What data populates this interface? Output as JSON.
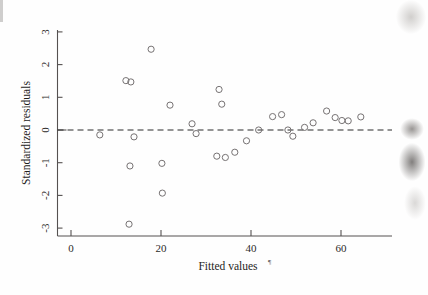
{
  "chart_data": {
    "type": "scatter",
    "title": "",
    "xlabel": "Fitted values",
    "ylabel": "Standardized residuals",
    "xlim": [
      -4,
      71
    ],
    "ylim": [
      -3.35,
      3.35
    ],
    "xticks": [
      0,
      20,
      40,
      60
    ],
    "xtick_labels": [
      "0",
      "20",
      "40",
      "60"
    ],
    "yticks": [
      -3,
      -2,
      -1,
      0,
      1,
      2,
      3
    ],
    "ytick_labels": [
      "-3",
      "-2",
      "-1",
      "0",
      "1",
      "2",
      "3"
    ],
    "grid": false,
    "legend": null,
    "reference_line": {
      "type": "horizontal",
      "y": 0,
      "style": "dashed"
    },
    "marker": {
      "shape": "circle",
      "filled": false,
      "radius_px": 3.1,
      "color": "#767273"
    },
    "points": [
      {
        "x": 6.4,
        "y": -0.15
      },
      {
        "x": 12.2,
        "y": 1.51
      },
      {
        "x": 13.3,
        "y": 1.47
      },
      {
        "x": 13.1,
        "y": -1.1
      },
      {
        "x": 12.9,
        "y": -2.88
      },
      {
        "x": 14.0,
        "y": -0.21
      },
      {
        "x": 17.8,
        "y": 2.47
      },
      {
        "x": 20.2,
        "y": -1.02
      },
      {
        "x": 20.3,
        "y": -1.93
      },
      {
        "x": 22.0,
        "y": 0.76
      },
      {
        "x": 26.9,
        "y": 0.19
      },
      {
        "x": 27.8,
        "y": -0.11
      },
      {
        "x": 32.9,
        "y": 1.24
      },
      {
        "x": 33.5,
        "y": 0.79
      },
      {
        "x": 32.4,
        "y": -0.8
      },
      {
        "x": 34.3,
        "y": -0.84
      },
      {
        "x": 36.4,
        "y": -0.68
      },
      {
        "x": 39.0,
        "y": -0.33
      },
      {
        "x": 41.7,
        "y": 0.0
      },
      {
        "x": 44.8,
        "y": 0.41
      },
      {
        "x": 46.8,
        "y": 0.47
      },
      {
        "x": 48.2,
        "y": 0.0
      },
      {
        "x": 49.3,
        "y": -0.19
      },
      {
        "x": 51.9,
        "y": 0.08
      },
      {
        "x": 53.8,
        "y": 0.22
      },
      {
        "x": 56.8,
        "y": 0.58
      },
      {
        "x": 58.7,
        "y": 0.38
      },
      {
        "x": 60.2,
        "y": 0.29
      },
      {
        "x": 61.6,
        "y": 0.28
      },
      {
        "x": 64.4,
        "y": 0.4
      }
    ]
  },
  "axes": {
    "x_title": "Fitted values",
    "y_title": "Standardized residuals",
    "footnote_mark": "¶"
  }
}
